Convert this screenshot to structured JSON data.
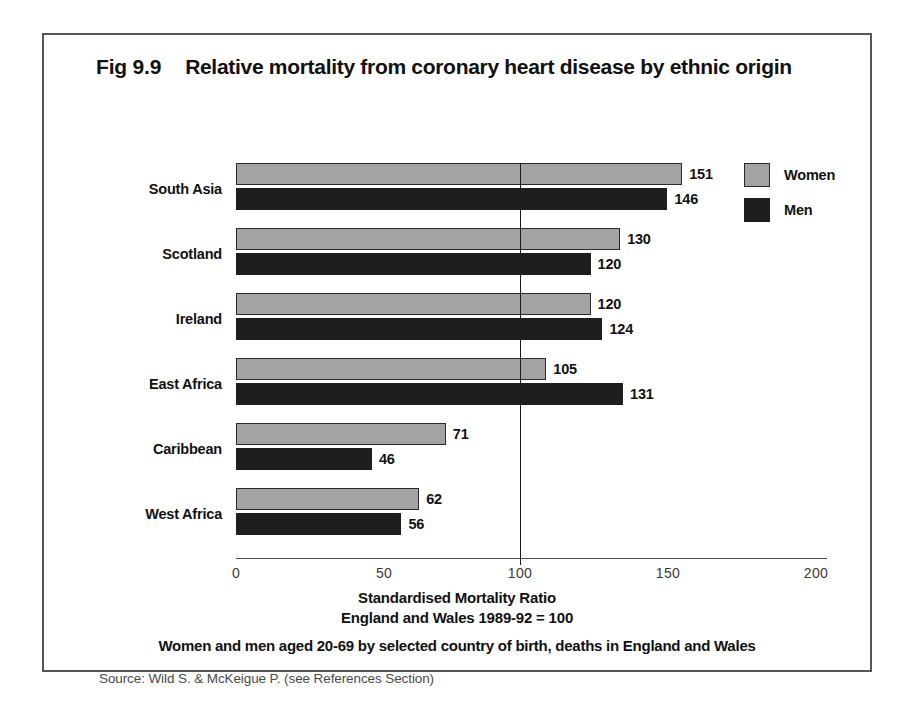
{
  "figure": {
    "number": "Fig 9.9",
    "title": "Relative mortality from coronary heart disease by ethnic origin",
    "sub_caption": "Women and men aged 20-69 by selected country of birth, deaths in England and Wales",
    "source": "Source:  Wild S. & McKeigue P. (see References Section)"
  },
  "legend": {
    "position": "top-right",
    "entries": [
      {
        "label": "Women",
        "color": "#a3a3a3"
      },
      {
        "label": "Men",
        "color": "#1e1e1e"
      }
    ]
  },
  "axis": {
    "caption_line1": "Standardised Mortality Ratio",
    "caption_line2": "England and Wales 1989-92 = 100",
    "ticks": [
      "0",
      "50",
      "100",
      "150",
      "200"
    ],
    "reference_value": "100"
  },
  "chart_data": {
    "type": "bar",
    "orientation": "horizontal",
    "title": "Relative mortality from coronary heart disease by ethnic origin",
    "subtitle": "Women and men aged 20-69 by selected country of birth, deaths in England and Wales",
    "xlabel": "Standardised Mortality Ratio / England and Wales 1989-92 = 100",
    "ylabel": "",
    "xlim": [
      0,
      200
    ],
    "xticks": [
      0,
      50,
      100,
      150,
      200
    ],
    "grid": false,
    "reference_line": 100,
    "legend_position": "top-right",
    "categories": [
      "South Asia",
      "Scotland",
      "Ireland",
      "East Africa",
      "Caribbean",
      "West Africa"
    ],
    "series": [
      {
        "name": "Women",
        "color": "#a3a3a3",
        "values": [
          151,
          130,
          120,
          105,
          71,
          62
        ]
      },
      {
        "name": "Men",
        "color": "#1e1e1e",
        "values": [
          146,
          120,
          124,
          131,
          46,
          56
        ]
      }
    ]
  }
}
